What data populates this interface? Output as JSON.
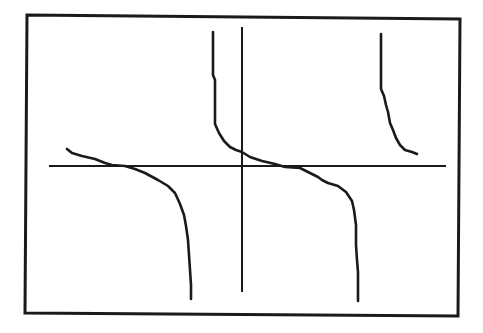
{
  "chart_data": {
    "type": "line",
    "title": "",
    "xlabel": "",
    "ylabel": "",
    "grid": false,
    "legend": null,
    "description": "Graphing-calculator style plot of a decreasing periodic function with vertical asymptotes (cotangent-like), three branches visible",
    "axes": {
      "x_axis_pixel_y": 166,
      "y_axis_pixel_x": 242,
      "x_axis_extent_px": [
        49,
        446
      ],
      "y_axis_extent_px": [
        27,
        292
      ],
      "tick_labels": []
    },
    "frame_px": {
      "top_left": [
        27,
        15
      ],
      "top_right": [
        460,
        19
      ],
      "bottom_right": [
        458,
        316
      ],
      "bottom_left": [
        25,
        313
      ]
    },
    "series": [
      {
        "name": "branch-left",
        "points_px": [
          [
            67,
            149
          ],
          [
            72,
            153
          ],
          [
            82,
            156
          ],
          [
            95,
            159
          ],
          [
            105,
            163
          ],
          [
            112,
            165
          ],
          [
            125,
            166
          ],
          [
            135,
            169
          ],
          [
            145,
            173
          ],
          [
            158,
            180
          ],
          [
            168,
            186
          ],
          [
            175,
            193
          ],
          [
            180,
            204
          ],
          [
            184,
            215
          ],
          [
            186,
            226
          ],
          [
            188,
            240
          ],
          [
            189,
            255
          ],
          [
            190,
            270
          ],
          [
            191,
            285
          ],
          [
            191,
            299
          ]
        ]
      },
      {
        "name": "branch-middle",
        "points_px": [
          [
            213,
            32
          ],
          [
            213,
            75
          ],
          [
            215,
            80
          ],
          [
            215,
            124
          ],
          [
            219,
            133
          ],
          [
            224,
            141
          ],
          [
            230,
            147
          ],
          [
            236,
            150
          ],
          [
            242,
            152
          ],
          [
            250,
            157
          ],
          [
            262,
            161
          ],
          [
            275,
            164
          ],
          [
            285,
            167
          ],
          [
            300,
            168
          ],
          [
            308,
            172
          ],
          [
            318,
            177
          ],
          [
            322,
            180
          ],
          [
            328,
            183
          ],
          [
            338,
            186
          ],
          [
            346,
            192
          ],
          [
            352,
            201
          ],
          [
            354,
            210
          ],
          [
            356,
            225
          ],
          [
            356,
            245
          ],
          [
            357,
            260
          ],
          [
            358,
            272
          ],
          [
            358,
            301
          ]
        ]
      },
      {
        "name": "branch-right",
        "points_px": [
          [
            381,
            34
          ],
          [
            381,
            89
          ],
          [
            384,
            96
          ],
          [
            386,
            105
          ],
          [
            388,
            112
          ],
          [
            390,
            123
          ],
          [
            393,
            130
          ],
          [
            396,
            138
          ],
          [
            400,
            145
          ],
          [
            405,
            150
          ],
          [
            412,
            152
          ],
          [
            417,
            154
          ]
        ]
      }
    ]
  }
}
